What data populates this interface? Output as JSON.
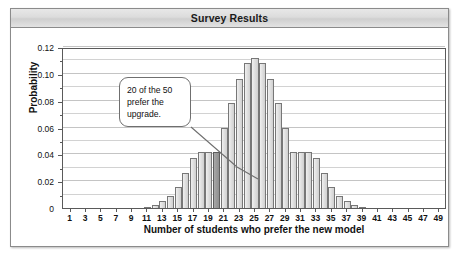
{
  "panel": {
    "title": "Survey Results"
  },
  "annotation": {
    "text": "20 of the 50 prefer the upgrade."
  },
  "colors": {
    "bar_fill": "#e2e2e2",
    "bar_edge": "#777777",
    "bar_highlight_fill": "#9c9c9c",
    "bar_highlight_edge": "#5e5e5e",
    "gridline": "#d2d2d2",
    "axis": "#5a5a5a",
    "panel_border": "#8b8b8b",
    "title_bar": "#dcdcdc",
    "text": "#111111"
  },
  "chart_data": {
    "type": "bar",
    "title": "Survey Results",
    "xlabel": "Number of students who prefer the new model",
    "ylabel": "Probability",
    "xlim": [
      0,
      50
    ],
    "ylim": [
      0,
      0.12
    ],
    "grid": true,
    "legend": "none",
    "ytick_labels": [
      "0",
      "0.02",
      "0.04",
      "0.06",
      "0.08",
      "0.10",
      "0.12"
    ],
    "ytick_values": [
      0,
      0.02,
      0.04,
      0.06,
      0.08,
      0.1,
      0.12
    ],
    "yminor_step": 0.01,
    "xtick_labels": [
      "1",
      "3",
      "5",
      "7",
      "9",
      "11",
      "13",
      "15",
      "17",
      "19",
      "21",
      "23",
      "25",
      "27",
      "29",
      "31",
      "33",
      "35",
      "37",
      "39",
      "41",
      "43",
      "45",
      "47",
      "49"
    ],
    "xtick_values": [
      1,
      3,
      5,
      7,
      9,
      11,
      13,
      15,
      17,
      19,
      21,
      23,
      25,
      27,
      29,
      31,
      33,
      35,
      37,
      39,
      41,
      43,
      45,
      47,
      49
    ],
    "highlight_category": 20,
    "highlight_label": "20 of the 50 prefer the upgrade.",
    "categories": [
      1,
      2,
      3,
      4,
      5,
      6,
      7,
      8,
      9,
      10,
      11,
      12,
      13,
      14,
      15,
      16,
      17,
      18,
      19,
      20,
      21,
      22,
      23,
      24,
      25,
      26,
      27,
      28,
      29,
      30,
      31,
      32,
      33,
      34,
      35,
      36,
      37,
      38,
      39,
      40,
      41,
      42,
      43,
      44,
      45,
      46,
      47,
      48,
      49,
      50
    ],
    "values": [
      0,
      0,
      0,
      0,
      0,
      0,
      0,
      0,
      0,
      0,
      0.001,
      0.002,
      0.005,
      0.009,
      0.016,
      0.026,
      0.037,
      0.042,
      0.042,
      0.042,
      0.06,
      0.078,
      0.096,
      0.108,
      0.112,
      0.108,
      0.096,
      0.078,
      0.06,
      0.042,
      0.042,
      0.042,
      0.037,
      0.026,
      0.016,
      0.009,
      0.005,
      0.002,
      0.001,
      0,
      0,
      0,
      0,
      0,
      0,
      0,
      0,
      0,
      0,
      0
    ]
  }
}
